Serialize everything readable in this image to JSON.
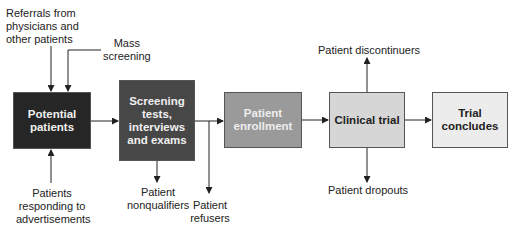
{
  "diagram": {
    "type": "flowchart",
    "colors": {
      "potential_patients_fill": "#262626",
      "screening_fill": "#474747",
      "enrollment_fill": "#9a9a9a",
      "clinical_trial_fill": "#d6d6d6",
      "trial_concludes_fill": "#ececec",
      "line": "#222222"
    },
    "nodes": [
      {
        "id": "potential_patients",
        "label": "Potential\npatients"
      },
      {
        "id": "screening",
        "label": "Screening\ntests,\ninterviews\nand exams"
      },
      {
        "id": "enrollment",
        "label": "Patient\nenrollment"
      },
      {
        "id": "clinical_trial",
        "label": "Clinical trial"
      },
      {
        "id": "trial_concludes",
        "label": "Trial\nconcludes"
      }
    ],
    "inputs": [
      {
        "id": "referrals",
        "label": "Referrals from\nphysicians and\nother patients",
        "target": "potential_patients"
      },
      {
        "id": "mass_screening",
        "label": "Mass\nscreening",
        "target": "potential_patients"
      },
      {
        "id": "advertisements",
        "label": "Patients\nresponding to\nadvertisements",
        "target": "potential_patients"
      }
    ],
    "outputs": [
      {
        "id": "nonqualifiers",
        "label": "Patient\nnonqualifiers",
        "source": "screening"
      },
      {
        "id": "refusers",
        "label": "Patient\nrefusers",
        "source": "screening"
      },
      {
        "id": "discontinuers",
        "label": "Patient discontinuers",
        "source": "clinical_trial"
      },
      {
        "id": "dropouts",
        "label": "Patient dropouts",
        "source": "clinical_trial"
      }
    ],
    "edges": [
      [
        "potential_patients",
        "screening"
      ],
      [
        "screening",
        "enrollment"
      ],
      [
        "enrollment",
        "clinical_trial"
      ],
      [
        "clinical_trial",
        "trial_concludes"
      ]
    ]
  }
}
